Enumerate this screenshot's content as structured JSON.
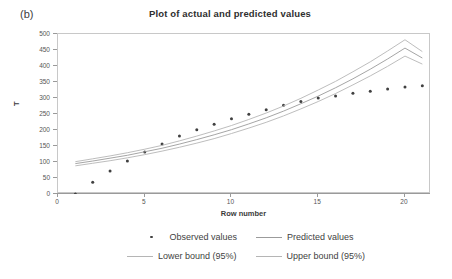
{
  "panel_label": "(b)",
  "chart_data": {
    "type": "scatter",
    "title": "Plot of actual and predicted values",
    "xlabel": "Row number",
    "ylabel": "T",
    "xlim": [
      0,
      21.5
    ],
    "ylim": [
      0,
      500
    ],
    "xticks": [
      0,
      5,
      10,
      15,
      20
    ],
    "yticks": [
      0,
      50,
      100,
      150,
      200,
      250,
      300,
      350,
      400,
      450,
      500
    ],
    "grid": false,
    "legend_position": "bottom",
    "x": [
      1,
      2,
      3,
      4,
      5,
      6,
      7,
      8,
      9,
      10,
      11,
      12,
      13,
      14,
      15,
      16,
      17,
      18,
      19,
      20,
      21
    ],
    "series": [
      {
        "name": "Observed values",
        "type": "scatter",
        "marker": "dot",
        "color": "#404040",
        "values": [
          0,
          37,
          72,
          103,
          131,
          156,
          181,
          201,
          218,
          235,
          249,
          263,
          277,
          289,
          300,
          306,
          315,
          321,
          328,
          334,
          338
        ]
      },
      {
        "name": "Predicted values",
        "type": "line",
        "color": "#9b9b9b",
        "values": [
          95,
          103,
          112,
          121,
          132,
          143,
          156,
          170,
          185,
          201,
          219,
          238,
          259,
          282,
          306,
          332,
          360,
          390,
          422,
          456,
          425
        ]
      },
      {
        "name": "Lower bound (95%)",
        "type": "line",
        "color": "#b5b5b5",
        "values": [
          88,
          96,
          104,
          113,
          123,
          134,
          146,
          159,
          173,
          189,
          206,
          224,
          244,
          266,
          289,
          314,
          341,
          369,
          399,
          431,
          406
        ]
      },
      {
        "name": "Upper bound (95%)",
        "type": "line",
        "color": "#b5b5b5",
        "values": [
          101,
          110,
          119,
          129,
          140,
          152,
          166,
          181,
          197,
          214,
          233,
          253,
          275,
          299,
          325,
          352,
          382,
          413,
          447,
          482,
          445
        ]
      }
    ]
  },
  "legend": {
    "rows": [
      [
        {
          "label": "Observed values",
          "key": "dot-marker"
        },
        {
          "label": "Predicted values",
          "key": "solid-line"
        }
      ],
      [
        {
          "label": "Lower bound (95%)",
          "key": "light-line"
        },
        {
          "label": "Upper bound (95%)",
          "key": "light-line"
        }
      ]
    ]
  }
}
